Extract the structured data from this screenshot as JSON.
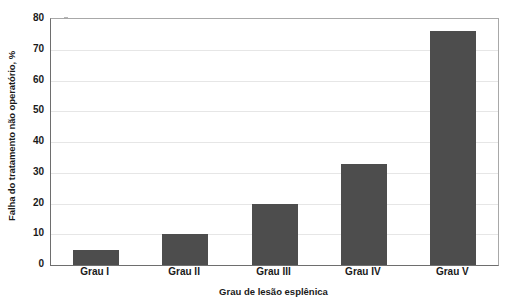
{
  "chart_data": {
    "type": "bar",
    "title": "",
    "subtitle": "",
    "xlabel": "Grau de lesão esplênica",
    "ylabel": "Falha do tratamento não operatório, %",
    "categories": [
      "Grau I",
      "Grau II",
      "Grau III",
      "Grau IV",
      "Grau V"
    ],
    "values": [
      5,
      10,
      20,
      33,
      76
    ],
    "series": [
      {
        "name": "Falha do tratamento não operatório",
        "values": [
          5,
          10,
          20,
          33,
          76
        ]
      }
    ],
    "ylim": [
      0,
      80
    ],
    "ytick_values": [
      0,
      10,
      20,
      30,
      40,
      50,
      60,
      70,
      80
    ],
    "ytick_labels": [
      "0",
      "10",
      "20",
      "30",
      "40",
      "50",
      "60",
      "70",
      "80"
    ],
    "grid": true,
    "grid_axis": "y",
    "legend": false,
    "legend_position": "none",
    "bar_color": "#4d4d4d",
    "grid_color": "#e6e6e6",
    "axis_color": "#6e6e6e",
    "plot_background": "#ffffff",
    "annotations": []
  }
}
